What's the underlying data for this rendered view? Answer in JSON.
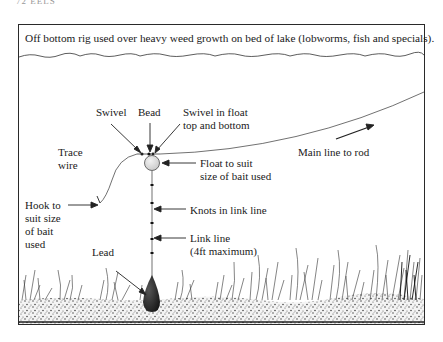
{
  "page_header": "72  EELS",
  "caption": "Off bottom rig used over heavy weed growth on bed of lake (lobworms, fish and specials).",
  "labels": {
    "swivel": "Swivel",
    "bead": "Bead",
    "swivel_float_1": "Swivel in float",
    "swivel_float_2": "top and bottom",
    "trace_1": "Trace",
    "trace_2": "wire",
    "main_line": "Main line to rod",
    "float_1": "Float to suit",
    "float_2": "size of bait used",
    "hook_1": "Hook to",
    "hook_2": "suit size",
    "hook_3": "of bait",
    "hook_4": "used",
    "knots": "Knots in link line",
    "link_1": "Link line",
    "link_2": "(4ft maximum)",
    "lead": "Lead"
  }
}
